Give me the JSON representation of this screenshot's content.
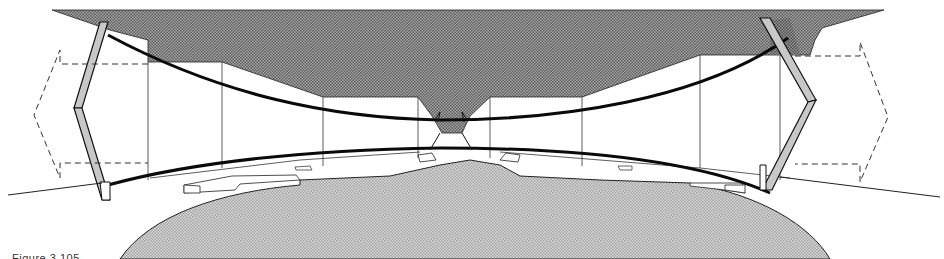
{
  "figure": {
    "caption": "Figure 3.105",
    "caption_visible": "partially clipped at bottom edge"
  },
  "colors": {
    "background": "#ffffff",
    "roof_hatch": "#8a8a8a",
    "ground_hatch": "#c4c4c4",
    "panel_fill": "#bdbdbd",
    "line": "#111111",
    "cable": "#0a0a0a"
  },
  "elements": {
    "roof_mass": "dark crosshatched roof volume with central funnel",
    "ground_mass": "light crosshatched elliptical mound",
    "left_panel": "tilted hinged wall panel (left)",
    "right_panel": "tilted hinged wall panel (right)",
    "upper_cable": "upper sagging catenary cable",
    "lower_cable": "lower hogging catenary cable",
    "left_dashed_arrow": "dashed movement indicator (left)",
    "right_dashed_arrow": "dashed movement indicator (right)",
    "ground_line_left": "sloping ground line (left)",
    "ground_line_right": "sloping ground line (right)"
  }
}
